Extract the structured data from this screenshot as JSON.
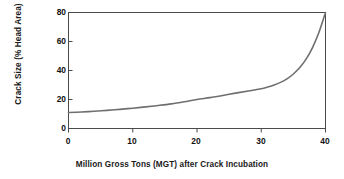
{
  "chart_data": {
    "type": "line",
    "title": "",
    "subtitle": "",
    "xlabel": "Million Gross Tons (MGT) after Crack Incubation",
    "ylabel": "Crack Size (% Head Area)",
    "xlim": [
      0,
      40
    ],
    "ylim": [
      0,
      80
    ],
    "xticks": [
      0,
      10,
      20,
      30,
      40
    ],
    "yticks": [
      0,
      20,
      40,
      60,
      80
    ],
    "xtick_labels": [
      "0",
      "10",
      "20",
      "30",
      "40"
    ],
    "ytick_labels": [
      "0",
      "20",
      "40",
      "60",
      "80"
    ],
    "grid": false,
    "legend": null,
    "legend_position": "none",
    "series": [
      {
        "name": "Crack growth",
        "color": "#6f6f6f",
        "line_width": 1.6,
        "x": [
          0,
          2,
          4,
          6,
          8,
          10,
          12,
          14,
          16,
          18,
          20,
          22,
          24,
          26,
          28,
          30,
          31,
          32,
          33,
          34,
          35,
          36,
          37,
          38,
          39,
          40
        ],
        "y": [
          11.0,
          11.4,
          11.9,
          12.5,
          13.2,
          14.0,
          14.9,
          15.9,
          17.0,
          18.4,
          20.0,
          21.3,
          22.8,
          24.4,
          25.9,
          27.4,
          28.6,
          30.0,
          31.8,
          34.2,
          37.6,
          42.0,
          48.0,
          56.0,
          66.5,
          80.0
        ]
      }
    ]
  },
  "axes": {
    "y_title": "Crack Size (% Head Area)",
    "x_title": "Million Gross Tons (MGT) after Crack Incubation"
  },
  "colors": {
    "curve": "#6f6f6f",
    "axis": "#4a4a4a",
    "text": "#111111",
    "background": "#ffffff"
  }
}
